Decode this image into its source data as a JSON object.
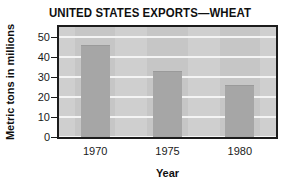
{
  "chart_data": {
    "type": "bar",
    "title": "UNITED STATES EXPORTS—WHEAT",
    "xlabel": "Year",
    "ylabel": "Metric tons in millions",
    "categories": [
      "1970",
      "1975",
      "1980"
    ],
    "values": [
      46,
      33,
      26
    ],
    "series": [
      {
        "name": "Wheat exports",
        "values": [
          46,
          33,
          26
        ]
      }
    ],
    "ylim": [
      0,
      55
    ],
    "yticks": [
      0,
      10,
      20,
      30,
      40,
      50
    ],
    "ytick_labels": [
      "0",
      "10",
      "20",
      "30",
      "40",
      "50"
    ],
    "xtick_labels": [
      "1970",
      "1975",
      "1980"
    ],
    "grid": "horizontal",
    "legend": "none",
    "colors": {
      "bar": "#a6a6a6",
      "plot_background": "#cfcfcf",
      "gridline": "#f4f4f4",
      "frame": "#1c1c1c",
      "text": "#101010",
      "page_background": "#ffffff"
    }
  }
}
